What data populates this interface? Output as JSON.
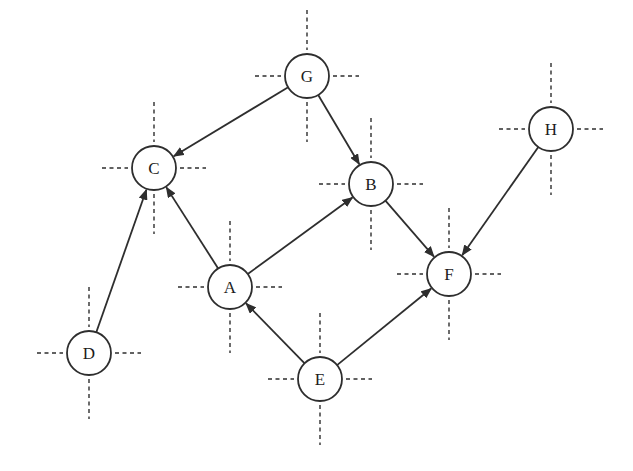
{
  "figure": {
    "type": "directed-graph",
    "canvas": {
      "width": 633,
      "height": 471
    },
    "background_color": "#ffffff",
    "stroke_color": "#2e2e2e",
    "node_fill": "#ffffff",
    "node_radius": 22,
    "node_stroke_width": 1.8,
    "edge_stroke_width": 1.8,
    "crosshair": {
      "dash_pattern": "4 3.5",
      "stroke_width": 1.4,
      "gap_from_center": 26,
      "horizontal_extent": 52,
      "vertical_extent": 66
    },
    "nodes": [
      {
        "id": "A",
        "label": "A",
        "x": 230,
        "y": 287
      },
      {
        "id": "B",
        "label": "B",
        "x": 371,
        "y": 184
      },
      {
        "id": "C",
        "label": "C",
        "x": 154,
        "y": 168
      },
      {
        "id": "D",
        "label": "D",
        "x": 89,
        "y": 353
      },
      {
        "id": "E",
        "label": "E",
        "x": 320,
        "y": 379
      },
      {
        "id": "F",
        "label": "F",
        "x": 449,
        "y": 274
      },
      {
        "id": "G",
        "label": "G",
        "x": 307,
        "y": 76
      },
      {
        "id": "H",
        "label": "H",
        "x": 551,
        "y": 129
      }
    ],
    "edges": [
      {
        "from": "G",
        "to": "C"
      },
      {
        "from": "G",
        "to": "B"
      },
      {
        "from": "A",
        "to": "C"
      },
      {
        "from": "A",
        "to": "B"
      },
      {
        "from": "D",
        "to": "C"
      },
      {
        "from": "E",
        "to": "A"
      },
      {
        "from": "E",
        "to": "F"
      },
      {
        "from": "B",
        "to": "F"
      },
      {
        "from": "H",
        "to": "F"
      }
    ]
  }
}
